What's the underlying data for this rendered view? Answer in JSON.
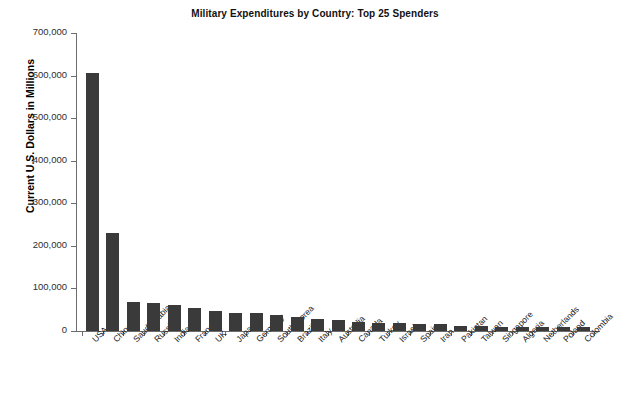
{
  "cropped_supertitle": "",
  "chart_data": {
    "type": "bar",
    "title": "Military Expenditures by Country: Top 25 Spenders",
    "xlabel": "",
    "ylabel": "Current U.S. Dollars in Millions",
    "ylim": [
      0,
      700000
    ],
    "ytick_labels": [
      "700,000",
      "600,000",
      "500,000",
      "400,000",
      "300,000",
      "200,000",
      "100,000",
      "0"
    ],
    "ytick_values": [
      700000,
      600000,
      500000,
      400000,
      300000,
      200000,
      100000,
      0
    ],
    "grid": false,
    "legend": "none",
    "bar_color": "#3a3a3a",
    "axis_color": "#6d6d6d",
    "categories": [
      "USA",
      "China",
      "Saudi Arabia",
      "Russia",
      "India",
      "France",
      "UK",
      "Japan",
      "Germany",
      "South Korea",
      "Brazil",
      "Italy",
      "Australia",
      "Canada",
      "Turkey",
      "Israel",
      "Spain",
      "Iran",
      "Pakistan",
      "Taiwan",
      "Singapore",
      "Algeria",
      "Netherlands",
      "Poland",
      "Colombia"
    ],
    "values": [
      606000,
      230000,
      68000,
      66000,
      61000,
      54000,
      46000,
      43000,
      42000,
      37000,
      32000,
      28000,
      26000,
      21000,
      19000,
      18000,
      17000,
      16000,
      11000,
      11000,
      10000,
      10000,
      10000,
      10000,
      10000
    ]
  }
}
